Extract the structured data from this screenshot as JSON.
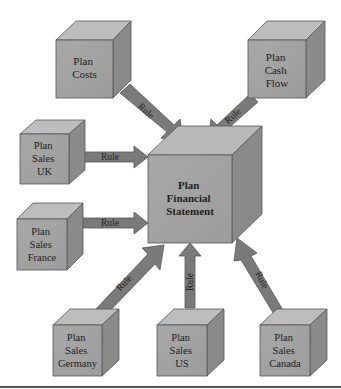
{
  "diagram": {
    "center": {
      "lines": [
        "Plan",
        "Financial",
        "Statement"
      ]
    },
    "sources": [
      {
        "id": "costs",
        "lines": [
          "Plan",
          "Costs"
        ]
      },
      {
        "id": "cashflow",
        "lines": [
          "Plan",
          "Cash",
          "Flow"
        ]
      },
      {
        "id": "uk",
        "lines": [
          "Plan",
          "Sales",
          "UK"
        ]
      },
      {
        "id": "france",
        "lines": [
          "Plan",
          "Sales",
          "France"
        ]
      },
      {
        "id": "germany",
        "lines": [
          "Plan",
          "Sales",
          "Germany"
        ]
      },
      {
        "id": "us",
        "lines": [
          "Plan",
          "Sales",
          "US"
        ]
      },
      {
        "id": "canada",
        "lines": [
          "Plan",
          "Sales",
          "Canada"
        ]
      }
    ],
    "arrow_label": "Rule",
    "colors": {
      "cube_front": "#a3a3a3",
      "cube_top": "#bdbdbd",
      "cube_side": "#8a8a8a",
      "arrow_fill": "#7a7a7a",
      "outline": "#555555"
    }
  }
}
